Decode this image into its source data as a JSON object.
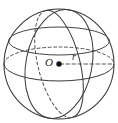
{
  "figure": {
    "kind": "sphere-diagram",
    "center_label": "O",
    "radius_label": "r",
    "background_color": "#ffffff",
    "stroke_color": "#3a3a3a",
    "point_color": "#111111",
    "dash_pattern": "3,2.5",
    "geometry": {
      "center_x": 59,
      "center_y": 64,
      "outline_radius": 55,
      "center_dot_radius": 2.6,
      "radius_line": {
        "from_x": 59,
        "from_y": 64,
        "to_x": 114,
        "to_y": 64,
        "style": "dashed"
      },
      "equator_ellipse": {
        "rx": 55,
        "ry": 17,
        "rotation_deg": 0,
        "front_style": "solid",
        "back_style": "dashed"
      },
      "meridian_left_ellipse": {
        "rx": 22,
        "ry": 55,
        "rotation_deg": -14,
        "front_style": "solid",
        "back_style": "dashed"
      },
      "meridian_right_ellipse": {
        "rx": 33,
        "ry": 55,
        "rotation_deg": 12,
        "front_style": "solid",
        "back_style": "dashed"
      },
      "upper_latitude_ellipse": {
        "rx": 52,
        "ry": 14,
        "center_offset_y": -24,
        "style": "solid"
      }
    }
  }
}
